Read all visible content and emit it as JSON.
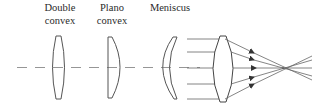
{
  "diagram": {
    "type": "lens-types-illustration",
    "labels": {
      "double_convex": {
        "line1": "Double",
        "line2": "convex"
      },
      "plano_convex": {
        "line1": "Plano",
        "line2": "convex"
      },
      "meniscus": {
        "line1": "Meniscus"
      }
    },
    "elements": [
      {
        "id": "double-convex-lens",
        "kind": "lens",
        "shape": "biconvex"
      },
      {
        "id": "plano-convex-lens",
        "kind": "lens",
        "shape": "plano-convex"
      },
      {
        "id": "meniscus-lens",
        "kind": "lens",
        "shape": "meniscus"
      },
      {
        "id": "converging-lens",
        "kind": "lens",
        "shape": "biconvex",
        "note": "parallel rays converge to focal point"
      }
    ],
    "rays": {
      "count": 5,
      "converge_to": "focal-point"
    },
    "colors": {
      "line": "#555555",
      "axis": "#8a8a8a",
      "background": "#ffffff"
    }
  }
}
